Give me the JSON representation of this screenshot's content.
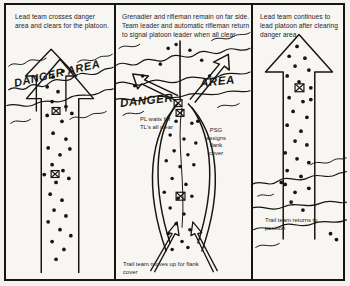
{
  "figure": {
    "background_color": "#f4f2ee",
    "ink_color": "#17150f"
  },
  "panels": [
    {
      "id": "panel-1",
      "caption": "Lead team crosses danger area and clears for the platoon.",
      "danger_area_label": "DANGER AREA",
      "notes": []
    },
    {
      "id": "panel-2",
      "caption": "Grenadier and rifleman remain on far side.\nTeam leader and automatic rifleman return to signal platoon leader when all clear",
      "danger_area_label_left": "DANGER",
      "danger_area_label_right": "AREA",
      "notes": [
        {
          "id": "pl-note",
          "text": "PL waits for\nTL's all clear"
        },
        {
          "id": "psg-note",
          "text": "PSG\nassigns\nflank\ncover"
        },
        {
          "id": "trail-up-note",
          "text": "Trail team moves up for flank cover"
        }
      ]
    },
    {
      "id": "panel-3",
      "caption": "Lead team continues to lead platoon after clearing danger area.",
      "notes": [
        {
          "id": "trail-return-note",
          "text": "Trail team returns to position"
        }
      ]
    }
  ],
  "symbols": {
    "soldier_dot": "soldier-dot",
    "leader_marker": "leader-marker",
    "arrow": "movement-arrow",
    "terrain": "danger-area-terrain"
  }
}
